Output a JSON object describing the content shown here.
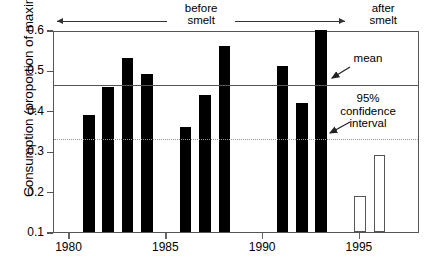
{
  "chart_data": {
    "type": "bar",
    "title": "",
    "xlabel": "",
    "ylabel": "Consumption (proportion of maximum)",
    "xlim": [
      1979.2,
      1998.1
    ],
    "ylim": [
      0.1,
      0.6
    ],
    "grid": false,
    "legend": "none",
    "x_tick_labels": [
      "1980",
      "1985",
      "1990",
      "1995"
    ],
    "x_tick_values": [
      1980,
      1985,
      1990,
      1995
    ],
    "y_tick_labels": [
      "0.6",
      "0.5",
      "0.4",
      "0.3",
      "0.2",
      "0.1"
    ],
    "y_tick_values": [
      0.6,
      0.5,
      0.4,
      0.3,
      0.2,
      0.1
    ],
    "categories": [
      1981,
      1982,
      1983,
      1984,
      1986,
      1987,
      1988,
      1991,
      1992,
      1993,
      1995,
      1996
    ],
    "values": [
      0.39,
      0.46,
      0.53,
      0.49,
      0.36,
      0.44,
      0.56,
      0.51,
      0.42,
      0.6,
      0.19,
      0.29
    ],
    "bars": [
      {
        "year": 1981,
        "value": 0.39,
        "style": "filled",
        "period": "before smelt"
      },
      {
        "year": 1982,
        "value": 0.46,
        "style": "filled",
        "period": "before smelt"
      },
      {
        "year": 1983,
        "value": 0.53,
        "style": "filled",
        "period": "before smelt"
      },
      {
        "year": 1984,
        "value": 0.49,
        "style": "filled",
        "period": "before smelt"
      },
      {
        "year": 1986,
        "value": 0.36,
        "style": "filled",
        "period": "before smelt"
      },
      {
        "year": 1987,
        "value": 0.44,
        "style": "filled",
        "period": "before smelt"
      },
      {
        "year": 1988,
        "value": 0.56,
        "style": "filled",
        "period": "before smelt"
      },
      {
        "year": 1991,
        "value": 0.51,
        "style": "filled",
        "period": "before smelt"
      },
      {
        "year": 1992,
        "value": 0.42,
        "style": "filled",
        "period": "before smelt"
      },
      {
        "year": 1993,
        "value": 0.6,
        "style": "filled",
        "period": "before smelt"
      },
      {
        "year": 1995,
        "value": 0.19,
        "style": "open",
        "period": "after smelt"
      },
      {
        "year": 1996,
        "value": 0.29,
        "style": "open",
        "period": "after smelt"
      }
    ],
    "reference_lines": [
      {
        "name": "mean",
        "value": 0.47,
        "style": "solid",
        "label": "mean"
      },
      {
        "name": "ci_lower",
        "value": 0.335,
        "style": "dotted",
        "label": "95% confidence interval"
      }
    ],
    "annotations": [
      {
        "name": "mean-annotation",
        "text": "mean"
      },
      {
        "name": "ci-annotation",
        "text": "95%\nconfidence\ninterval"
      }
    ],
    "period_brackets": [
      {
        "name": "before-smelt",
        "label_line1": "before",
        "label_line2": "smelt",
        "from": 1979.4,
        "to": 1994.3
      },
      {
        "name": "after-smelt",
        "label_line1": "after",
        "label_line2": "smelt",
        "from": 1994.5,
        "to": 1998.0
      }
    ]
  },
  "labels": {
    "y_axis_title": "Consumption (proportion of maximum)",
    "mean_annotation": "mean",
    "ci_line1": "95%",
    "ci_line2": "confidence",
    "ci_line3": "interval",
    "before_line1": "before",
    "before_line2": "smelt",
    "after_line1": "after",
    "after_line2": "smelt"
  },
  "colors": {
    "bar_filled": "#000000",
    "bar_open_fill": "#ffffff",
    "bar_open_stroke": "#555555",
    "mean_line": "#555555",
    "ci_line": "#999999",
    "axis": "#555555",
    "text": "#000000",
    "background": "#ffffff"
  }
}
